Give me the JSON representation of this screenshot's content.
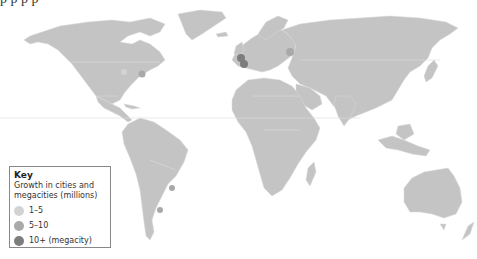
{
  "caption_fragment": "p                              p p               p",
  "colors": {
    "land": "#c4c4c4",
    "border": "#dcdcdc",
    "background": "#ffffff",
    "tier_1_5": "#d3d3d3",
    "tier_5_10": "#a9a9a9",
    "tier_10_plus": "#7d7d7d"
  },
  "key": {
    "title": "Key",
    "subtitle_line1": "Growth in cities and",
    "subtitle_line2": "megacities (millions)",
    "entries": [
      {
        "label": "1–5",
        "color": "#d3d3d3"
      },
      {
        "label": "5–10",
        "color": "#a9a9a9"
      },
      {
        "label": "10+ (megacity)",
        "color": "#7d7d7d"
      }
    ]
  }
}
